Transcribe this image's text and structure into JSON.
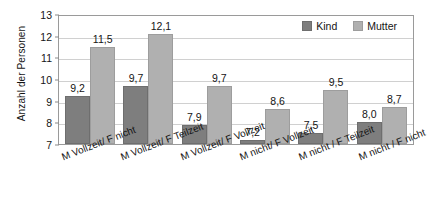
{
  "chart_data": {
    "type": "bar",
    "title": "",
    "xlabel": "",
    "ylabel": "Anzahl der Personen",
    "ylim": [
      7,
      13
    ],
    "yticks": [
      7,
      8,
      9,
      10,
      11,
      12,
      13
    ],
    "grid": true,
    "legend_position": "top-right-inside",
    "decimal_separator": ",",
    "categories": [
      "M Vollzeit/ F nicht",
      "M Vollzeit/ F Teilzeit",
      "M Vollzeit/ F Vollzeit",
      "M nicht/ F Vollzeit",
      "M nicht / F Teilzeit",
      "M nicht / F nicht"
    ],
    "series": [
      {
        "name": "Kind",
        "color": "#7e7e7e",
        "values": [
          9.2,
          9.7,
          7.9,
          7.2,
          7.5,
          8.0
        ],
        "labels": [
          "9,2",
          "9,7",
          "7,9",
          "7,2",
          "7,5",
          "8,0"
        ]
      },
      {
        "name": "Mutter",
        "color": "#b0b0b0",
        "values": [
          11.5,
          12.1,
          9.7,
          8.6,
          9.5,
          8.7
        ],
        "labels": [
          "11,5",
          "12,1",
          "9,7",
          "8,6",
          "9,5",
          "8,7"
        ]
      }
    ]
  },
  "legend": {
    "items": [
      {
        "label": "Kind"
      },
      {
        "label": "Mutter"
      }
    ]
  }
}
